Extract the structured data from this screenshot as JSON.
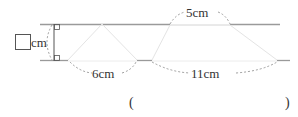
{
  "diagram": {
    "height_label": {
      "blank": true,
      "unit": "cm"
    },
    "triangle": {
      "base_label": "6cm"
    },
    "trapezoid": {
      "top_label": "5cm",
      "bottom_label": "11cm"
    },
    "answer": {
      "open": "(",
      "close": ")"
    }
  },
  "colors": {
    "line": "#9a9a9a",
    "faint": "#e4e4e4",
    "dash": "#888888",
    "text": "#333333"
  }
}
